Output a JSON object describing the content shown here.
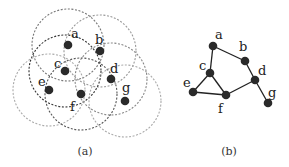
{
  "figure": {
    "panel_a": {
      "caption": "(a)",
      "description": "Unit-disk coverage: each node surrounded by a dashed communication-range circle",
      "radius": 36,
      "nodes": [
        {
          "id": "a",
          "x": 68,
          "y": 45,
          "lx": 71,
          "ly": 38,
          "ring": "#777777"
        },
        {
          "id": "b",
          "x": 100,
          "y": 51,
          "lx": 95,
          "ly": 44,
          "ring": "#999999"
        },
        {
          "id": "c",
          "x": 65,
          "y": 71,
          "lx": 54,
          "ly": 68,
          "ring": "#333333"
        },
        {
          "id": "d",
          "x": 111,
          "y": 79,
          "lx": 110,
          "ly": 73,
          "ring": "#888888"
        },
        {
          "id": "e",
          "x": 49,
          "y": 90,
          "lx": 38,
          "ly": 86,
          "ring": "#aaaaaa"
        },
        {
          "id": "f",
          "x": 81,
          "y": 94,
          "lx": 70,
          "ly": 111,
          "ring": "#555555"
        },
        {
          "id": "g",
          "x": 125,
          "y": 101,
          "lx": 122,
          "ly": 92,
          "ring": "#aaaaaa"
        }
      ]
    },
    "panel_b": {
      "caption": "(b)",
      "description": "Corresponding connectivity graph",
      "nodes": [
        {
          "id": "a",
          "x": 213,
          "y": 46,
          "lx": 215,
          "ly": 39
        },
        {
          "id": "b",
          "x": 245,
          "y": 61,
          "lx": 239,
          "ly": 51
        },
        {
          "id": "c",
          "x": 210,
          "y": 73,
          "lx": 199,
          "ly": 70
        },
        {
          "id": "d",
          "x": 255,
          "y": 80,
          "lx": 258,
          "ly": 75
        },
        {
          "id": "e",
          "x": 193,
          "y": 92,
          "lx": 183,
          "ly": 87
        },
        {
          "id": "f",
          "x": 226,
          "y": 95,
          "lx": 218,
          "ly": 113
        },
        {
          "id": "g",
          "x": 268,
          "y": 103,
          "lx": 268,
          "ly": 97
        }
      ],
      "edges": [
        [
          "a",
          "b"
        ],
        [
          "a",
          "c"
        ],
        [
          "b",
          "d"
        ],
        [
          "c",
          "e"
        ],
        [
          "c",
          "f"
        ],
        [
          "e",
          "f"
        ],
        [
          "f",
          "d"
        ],
        [
          "d",
          "g"
        ]
      ]
    }
  }
}
